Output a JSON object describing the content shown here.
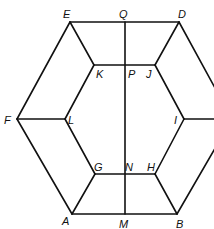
{
  "diagram": {
    "title": "",
    "colors": {
      "line": "#111111",
      "background": "#ffffff"
    },
    "vertices": {
      "A": [
        72,
        214
      ],
      "B": [
        177,
        214
      ],
      "C": [
        232,
        119
      ],
      "D": [
        179,
        22
      ],
      "E": [
        70,
        22
      ],
      "F": [
        17,
        119
      ],
      "G": [
        95,
        174
      ],
      "H": [
        155,
        174
      ],
      "I": [
        184,
        119
      ],
      "J": [
        155,
        65
      ],
      "K": [
        94,
        65
      ],
      "L": [
        65,
        119
      ],
      "M": [
        125,
        214
      ],
      "N": [
        125,
        174
      ],
      "P": [
        125,
        65
      ],
      "Q": [
        125,
        22
      ]
    },
    "labels": [
      {
        "name": "E",
        "x": 63,
        "y": 18
      },
      {
        "name": "Q",
        "x": 119,
        "y": 18
      },
      {
        "name": "D",
        "x": 178,
        "y": 18
      },
      {
        "name": "K",
        "x": 96,
        "y": 78
      },
      {
        "name": "P",
        "x": 128,
        "y": 78
      },
      {
        "name": "J",
        "x": 146,
        "y": 78
      },
      {
        "name": "F",
        "x": 4,
        "y": 124
      },
      {
        "name": "L",
        "x": 68,
        "y": 124
      },
      {
        "name": "I",
        "x": 174,
        "y": 124
      },
      {
        "name": "G",
        "x": 94,
        "y": 171
      },
      {
        "name": "N",
        "x": 125,
        "y": 171
      },
      {
        "name": "H",
        "x": 147,
        "y": 171
      },
      {
        "name": "A",
        "x": 62,
        "y": 225
      },
      {
        "name": "M",
        "x": 119,
        "y": 228
      },
      {
        "name": "B",
        "x": 176,
        "y": 228
      }
    ],
    "edges": [
      [
        "E",
        "D"
      ],
      [
        "D",
        "C"
      ],
      [
        "C",
        "B"
      ],
      [
        "B",
        "A"
      ],
      [
        "A",
        "F"
      ],
      [
        "F",
        "E"
      ],
      [
        "K",
        "J"
      ],
      [
        "J",
        "I"
      ],
      [
        "I",
        "H"
      ],
      [
        "H",
        "G"
      ],
      [
        "G",
        "L"
      ],
      [
        "L",
        "K"
      ],
      [
        "E",
        "K"
      ],
      [
        "D",
        "J"
      ],
      [
        "I",
        "C"
      ],
      [
        "B",
        "H"
      ],
      [
        "A",
        "G"
      ],
      [
        "F",
        "L"
      ],
      [
        "Q",
        "M"
      ]
    ]
  }
}
